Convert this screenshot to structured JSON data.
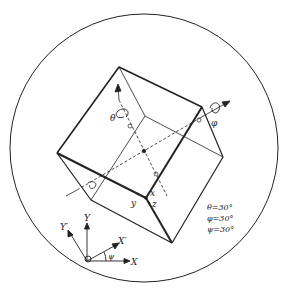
{
  "diagram": {
    "colors": {
      "line": "#222222",
      "background": "#ffffff"
    },
    "rotation_labels": {
      "theta": "θ",
      "phi": "φ",
      "psi": "ψ"
    },
    "corner_axes": {
      "x": "x",
      "y": "y",
      "z": "z"
    },
    "frame_axes": {
      "X": "X",
      "Y": "Y",
      "X_prime": "X′",
      "Y_prime": "Y′",
      "angle": "ψ"
    },
    "angle_values": [
      {
        "label": "θ=30°"
      },
      {
        "label": "φ=30°"
      },
      {
        "label": "ψ=30°"
      }
    ]
  }
}
